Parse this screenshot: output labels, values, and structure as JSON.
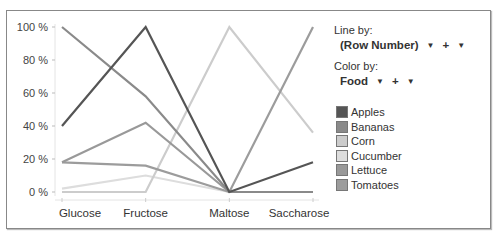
{
  "controls": {
    "line_by_label": "Line by:",
    "line_by_value": "(Row Number)",
    "color_by_label": "Color by:",
    "color_by_value": "Food",
    "plus": "+",
    "arrow": "▼"
  },
  "chart_data": {
    "type": "line",
    "title": "",
    "xlabel": "",
    "ylabel": "",
    "categories": [
      "Glucose",
      "Fructose",
      "Maltose",
      "Saccharose"
    ],
    "yticks": [
      "0 %",
      "20 %",
      "40 %",
      "60 %",
      "80 %",
      "100 %"
    ],
    "ylim": [
      0,
      100
    ],
    "legend_position": "right",
    "series": [
      {
        "name": "Apples",
        "color": "#555555",
        "values": [
          40,
          100,
          0,
          18
        ]
      },
      {
        "name": "Bananas",
        "color": "#8a8a8a",
        "values": [
          100,
          58,
          0,
          0
        ]
      },
      {
        "name": "Corn",
        "color": "#cccccc",
        "values": [
          0,
          0,
          100,
          36
        ]
      },
      {
        "name": "Cucumber",
        "color": "#dddddd",
        "values": [
          2,
          10,
          0,
          0
        ]
      },
      {
        "name": "Lettuce",
        "color": "#999999",
        "values": [
          18,
          42,
          0,
          0
        ]
      },
      {
        "name": "Tomatoes",
        "color": "#9c9c9c",
        "values": [
          18,
          16,
          0,
          100
        ]
      }
    ]
  }
}
